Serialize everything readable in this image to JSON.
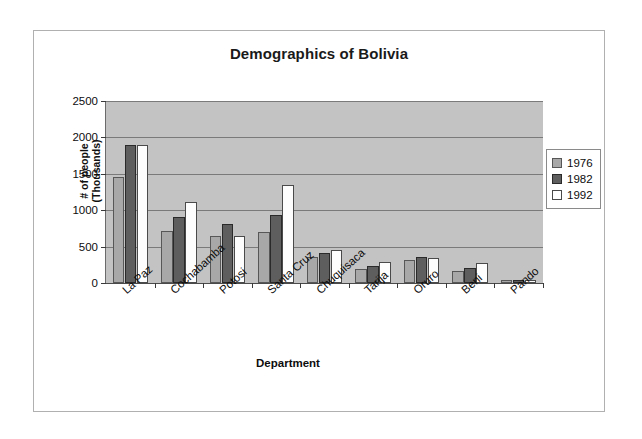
{
  "chart_data": {
    "type": "bar",
    "title": "Demographics of Bolivia",
    "xlabel": "Department",
    "ylabel_line1": "# of people",
    "ylabel_line2": "(Thousands)",
    "categories": [
      "La Paz",
      "Cochabamba",
      "Potosi",
      "Santa Cruz",
      "Chuquisaca",
      "Tarija",
      "Oruro",
      "Beni",
      "Pando"
    ],
    "series": [
      {
        "name": "1976",
        "color": "#a8a8a8",
        "values": [
          1460,
          720,
          650,
          700,
          360,
          190,
          310,
          170,
          35
        ]
      },
      {
        "name": "1982",
        "color": "#5e5e5e",
        "values": [
          1900,
          910,
          810,
          940,
          410,
          240,
          360,
          210,
          45
        ]
      },
      {
        "name": "1992",
        "color": "#ffffff",
        "values": [
          1900,
          1110,
          645,
          1350,
          450,
          290,
          340,
          280,
          40
        ]
      }
    ],
    "ylim": [
      0,
      2500
    ],
    "yticks": [
      0,
      500,
      1000,
      1500,
      2000,
      2500
    ],
    "ytick_labels": [
      "0",
      "500",
      "1000",
      "1500",
      "2000",
      "2500"
    ],
    "grid": true,
    "legend_position": "right",
    "legend_entries": [
      "1976",
      "1982",
      "1992"
    ],
    "plot_background": "#c3c3c3",
    "frame_background": "#ffffff"
  }
}
